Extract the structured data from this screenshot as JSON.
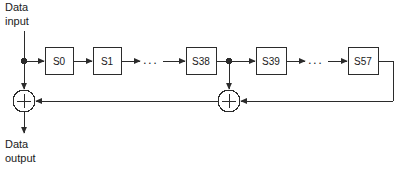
{
  "diagram": {
    "type": "lfsr-block-diagram",
    "title": "",
    "colors": {
      "stroke": "#2b2b2b",
      "box_fill": "#ffffff",
      "text": "#1a1a1a",
      "background": "#ffffff"
    },
    "labels": {
      "data_input_line1": "Data",
      "data_input_line2": "input",
      "data_output_line1": "Data",
      "data_output_line2": "output"
    },
    "registers": [
      {
        "name": "S0",
        "label": "S0",
        "x": 45,
        "y": 47,
        "w": 28,
        "h": 27
      },
      {
        "name": "S1",
        "label": "S1",
        "x": 93,
        "y": 47,
        "w": 28,
        "h": 27
      },
      {
        "name": "S38",
        "label": "S38",
        "x": 186,
        "y": 47,
        "w": 30,
        "h": 27
      },
      {
        "name": "S39",
        "label": "S39",
        "x": 256,
        "y": 47,
        "w": 30,
        "h": 27
      },
      {
        "name": "S57",
        "label": "S57",
        "x": 348,
        "y": 47,
        "w": 30,
        "h": 27
      }
    ],
    "ellipses": [
      {
        "name": "ellipsis-left",
        "text": "...",
        "x": 151,
        "y": 61
      },
      {
        "name": "ellipsis-right",
        "text": "...",
        "x": 316,
        "y": 61
      }
    ],
    "adders": [
      {
        "name": "xor-output",
        "symbol": "+",
        "cx": 24,
        "cy": 101,
        "r": 11
      },
      {
        "name": "xor-feedback",
        "symbol": "+",
        "cx": 229,
        "cy": 101,
        "r": 11
      }
    ],
    "junctions": [
      {
        "name": "junction-input-tap",
        "cx": 24,
        "cy": 61,
        "r": 3
      },
      {
        "name": "junction-s38-tap",
        "cx": 229,
        "cy": 61,
        "r": 3
      }
    ]
  }
}
